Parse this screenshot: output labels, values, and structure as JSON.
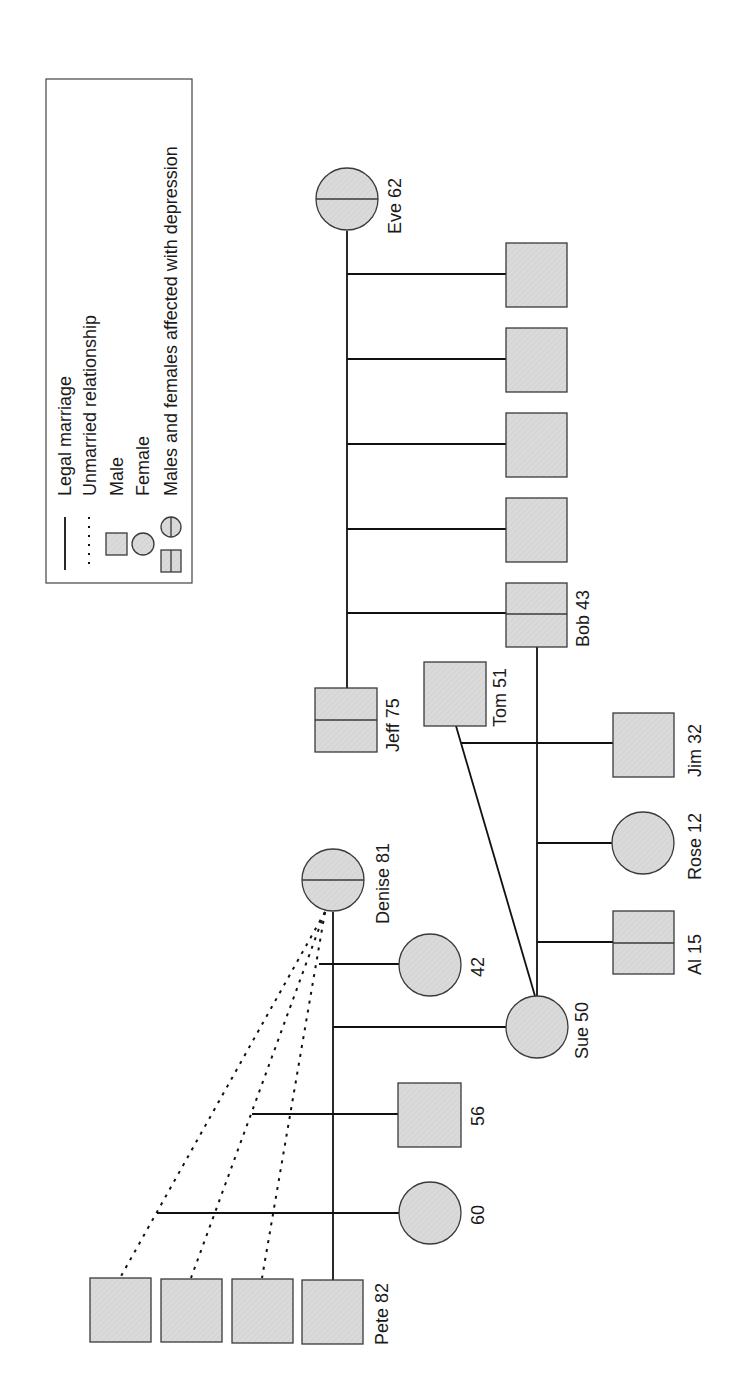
{
  "legend": {
    "items": [
      {
        "symbol": "solid-line",
        "label": "Legal marriage"
      },
      {
        "symbol": "dotted-line",
        "label": "Unmarried relationship"
      },
      {
        "symbol": "square",
        "label": "Male"
      },
      {
        "symbol": "circle",
        "label": "Female"
      },
      {
        "symbol": "affected-square-circle",
        "label": "Males and females affected with depression"
      }
    ]
  },
  "colors": {
    "fill": "#d9d9d9",
    "stroke": "#3a3a3a",
    "line": "#111111"
  },
  "people": [
    {
      "id": "eve",
      "name": "Eve 62",
      "sex": "female",
      "affected": true
    },
    {
      "id": "jeff",
      "name": "Jeff 75",
      "sex": "male",
      "affected": true
    },
    {
      "id": "c1",
      "name": "",
      "sex": "male",
      "affected": false
    },
    {
      "id": "c2",
      "name": "",
      "sex": "male",
      "affected": false
    },
    {
      "id": "c3",
      "name": "",
      "sex": "male",
      "affected": false
    },
    {
      "id": "c4",
      "name": "",
      "sex": "male",
      "affected": false
    },
    {
      "id": "bob",
      "name": "Bob 43",
      "sex": "male",
      "affected": true
    },
    {
      "id": "tom",
      "name": "Tom 51",
      "sex": "male",
      "affected": false
    },
    {
      "id": "jim",
      "name": "Jim 32",
      "sex": "male",
      "affected": false
    },
    {
      "id": "rose",
      "name": "Rose 12",
      "sex": "female",
      "affected": false
    },
    {
      "id": "al",
      "name": "Al 15",
      "sex": "male",
      "affected": true
    },
    {
      "id": "sue",
      "name": "Sue 50",
      "sex": "female",
      "affected": false
    },
    {
      "id": "denise",
      "name": "Denise 81",
      "sex": "female",
      "affected": true
    },
    {
      "id": "d42",
      "name": "42",
      "sex": "female",
      "affected": false
    },
    {
      "id": "d56",
      "name": "56",
      "sex": "male",
      "affected": false
    },
    {
      "id": "d60",
      "name": "60",
      "sex": "female",
      "affected": false
    },
    {
      "id": "pete",
      "name": "Pete 82",
      "sex": "male",
      "affected": false
    },
    {
      "id": "p1",
      "name": "",
      "sex": "male",
      "affected": false
    },
    {
      "id": "p2",
      "name": "",
      "sex": "male",
      "affected": false
    },
    {
      "id": "p3",
      "name": "",
      "sex": "male",
      "affected": false
    }
  ],
  "relationships": [
    {
      "from": "eve",
      "to": "jeff",
      "type": "legal-marriage",
      "children": [
        "c1",
        "c2",
        "c3",
        "c4",
        "bob"
      ]
    },
    {
      "from": "bob",
      "to": "sue",
      "type": "legal-marriage",
      "children": [
        "rose",
        "al"
      ]
    },
    {
      "from": "tom",
      "to": "sue",
      "type": "legal-marriage",
      "children": [
        "jim"
      ]
    },
    {
      "from": "denise",
      "to": "pete",
      "type": "legal-marriage",
      "children": [
        "sue"
      ]
    },
    {
      "from": "denise",
      "to": "p3",
      "type": "unmarried-relationship",
      "children": [
        "d42"
      ]
    },
    {
      "from": "denise",
      "to": "p2",
      "type": "unmarried-relationship",
      "children": [
        "d56"
      ]
    },
    {
      "from": "denise",
      "to": "p1",
      "type": "unmarried-relationship",
      "children": [
        "d60"
      ]
    }
  ]
}
